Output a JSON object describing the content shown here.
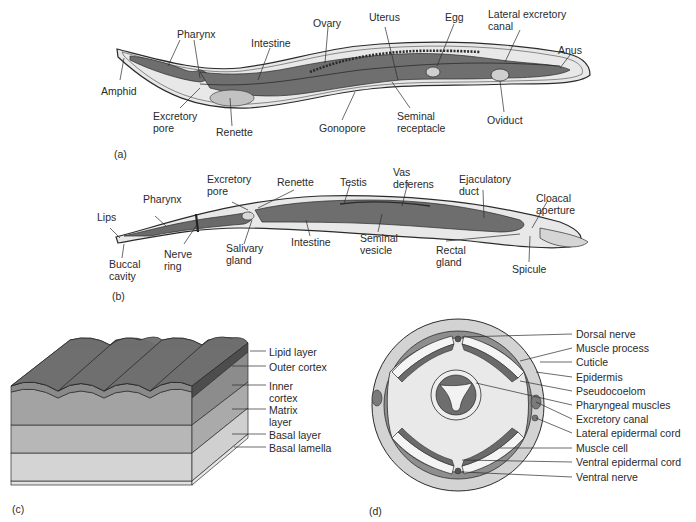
{
  "figure": {
    "panels": [
      {
        "id": "a",
        "tag": "(a)",
        "subject": "Female nematode, longitudinal anatomy",
        "labels": [
          "Pharynx",
          "Intestine",
          "Ovary",
          "Uterus",
          "Egg",
          "Lateral excretory\ncanal",
          "Anus",
          "Amphid",
          "Excretory\npore",
          "Renette",
          "Gonopore",
          "Seminal\nreceptacle",
          "Oviduct"
        ]
      },
      {
        "id": "b",
        "tag": "(b)",
        "subject": "Male nematode, longitudinal anatomy",
        "labels": [
          "Excretory\npore",
          "Renette",
          "Testis",
          "Vas\ndeferens",
          "Ejaculatory\nduct",
          "Pharynx",
          "Cloacal\naperture",
          "Lips",
          "Buccal\ncavity",
          "Nerve\nring",
          "Salivary\ngland",
          "Intestine",
          "Seminal\nvesicle",
          "Rectal\ngland",
          "Spicule"
        ]
      },
      {
        "id": "c",
        "tag": "(c)",
        "subject": "Cuticle layers",
        "labels": [
          "Lipid layer",
          "Outer cortex",
          "Inner\ncortex",
          "Matrix\nlayer",
          "Basal layer",
          "Basal lamella"
        ]
      },
      {
        "id": "d",
        "tag": "(d)",
        "subject": "Cross section",
        "labels": [
          "Dorsal nerve",
          "Muscle process",
          "Cuticle",
          "Epidermis",
          "Pseudocoelom",
          "Pharyngeal muscles",
          "Excretory canal",
          "Lateral epidermal cord",
          "Muscle cell",
          "Ventral epidermal cord",
          "Ventral nerve"
        ]
      }
    ]
  },
  "colors": {
    "outline": "#2b2b2b",
    "body_light": "#e6e6e6",
    "organ_dark": "#6e6e6e",
    "organ_mid": "#9a9a9a",
    "organ_light": "#c4c4c4",
    "cuticle_top": "#767676",
    "cuticle_outer": "#5a5a5a",
    "inner_cortex": "#8e8e8e",
    "matrix": "#a9a9a9",
    "basal": "#c8c8c8",
    "lamella": "#e2e2e2",
    "cross_outer": "#d3d3d3",
    "cross_ring": "#8c8c8c",
    "pseudocoel": "#e9e9e9"
  }
}
